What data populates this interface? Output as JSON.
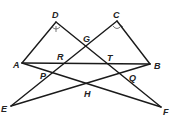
{
  "diagram": {
    "type": "geometry",
    "points": {
      "A": {
        "label": "A",
        "x": 22,
        "y": 63
      },
      "B": {
        "label": "B",
        "x": 150,
        "y": 64
      },
      "C": {
        "label": "C",
        "x": 117,
        "y": 21
      },
      "D": {
        "label": "D",
        "x": 56,
        "y": 22
      },
      "E": {
        "label": "E",
        "x": 11,
        "y": 106
      },
      "F": {
        "label": "F",
        "x": 161,
        "y": 107
      },
      "G": {
        "label": "G",
        "x": 86,
        "y": 47
      },
      "R": {
        "label": "R",
        "x": 64,
        "y": 63
      },
      "T": {
        "label": "T",
        "x": 109,
        "y": 64
      },
      "P": {
        "label": "P",
        "x": 51,
        "y": 74
      },
      "Q": {
        "label": "Q",
        "x": 125,
        "y": 76
      },
      "H": {
        "label": "H",
        "x": 88,
        "y": 84
      }
    },
    "segments": [
      "AD",
      "DF",
      "AB",
      "AF",
      "CB",
      "CE",
      "EB"
    ],
    "angle_marks": [
      "angle D",
      "angle C"
    ]
  }
}
